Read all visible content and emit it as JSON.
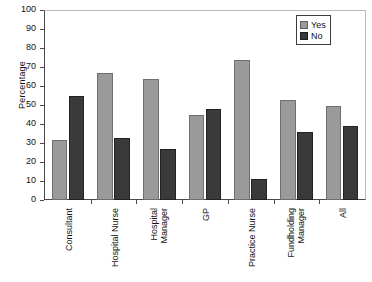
{
  "chart_data": {
    "type": "bar",
    "title": "",
    "xlabel": "",
    "ylabel": "Percentage",
    "ylim": [
      0,
      100
    ],
    "ytick_step": 10,
    "yticks": [
      100,
      90,
      80,
      70,
      60,
      50,
      40,
      30,
      20,
      10,
      0
    ],
    "grid": false,
    "legend_position": "top-right",
    "categories": [
      "Consultant",
      "Hospital Nurse",
      "Hospital Manager",
      "GP",
      "Practice Nurse",
      "Fundholding Manager",
      "All"
    ],
    "category_lines": [
      [
        "Consultant"
      ],
      [
        "Hospital Nurse"
      ],
      [
        "Hospital",
        "Manager"
      ],
      [
        "GP"
      ],
      [
        "Practice Nurse"
      ],
      [
        "Fundholding",
        "Manager"
      ],
      [
        "All"
      ]
    ],
    "series": [
      {
        "name": "Yes",
        "color": "#9a9a9a",
        "values": [
          32,
          67,
          64,
          45,
          74,
          53,
          50
        ]
      },
      {
        "name": "No",
        "color": "#3a3a3a",
        "values": [
          55,
          33,
          27,
          48,
          11,
          36,
          39
        ]
      }
    ]
  },
  "legend": {
    "items": [
      {
        "label": "Yes",
        "key": "yes"
      },
      {
        "label": "No",
        "key": "no"
      }
    ]
  }
}
